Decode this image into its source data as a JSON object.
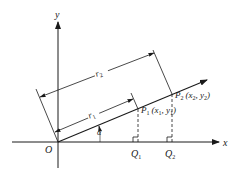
{
  "diagram": {
    "axes": {
      "x_label": "x",
      "y_label": "y",
      "origin_label": "O"
    },
    "points": {
      "p1": {
        "name": "P",
        "sub": "1",
        "coords": "(x",
        "coords_sub1": "1",
        "coords_mid": ", y",
        "coords_sub2": "1",
        "coords_end": ")"
      },
      "p2": {
        "name": "P",
        "sub": "2",
        "coords": "(x",
        "coords_sub1": "2",
        "coords_mid": ", y",
        "coords_sub2": "2",
        "coords_end": ")"
      },
      "q1": {
        "name": "Q",
        "sub": "1"
      },
      "q2": {
        "name": "Q",
        "sub": "2"
      }
    },
    "distances": {
      "r1": {
        "name": "r",
        "sub": "1"
      },
      "r2": {
        "name": "r",
        "sub": "2"
      }
    },
    "angle_label": "α",
    "colors": {
      "stroke": "#1a1a1a",
      "background": "#ffffff"
    }
  }
}
